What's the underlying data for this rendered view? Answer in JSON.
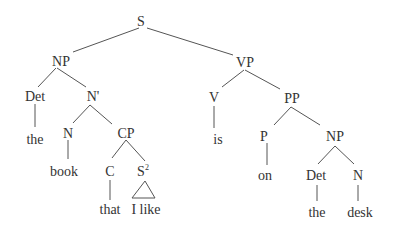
{
  "tree": {
    "root": "S",
    "subject_np": "NP",
    "det": "Det",
    "det_word": "the",
    "nbar": "N'",
    "n": "N",
    "n_word": "book",
    "cp": "CP",
    "c": "C",
    "c_word": "that",
    "s2": "S",
    "s2_sup": "2",
    "s2_words": "I like",
    "vp": "VP",
    "v": "V",
    "v_word": "is",
    "pp": "PP",
    "p": "P",
    "p_word": "on",
    "obj_np": "NP",
    "obj_det": "Det",
    "obj_det_word": "the",
    "obj_n": "N",
    "obj_n_word": "desk"
  }
}
